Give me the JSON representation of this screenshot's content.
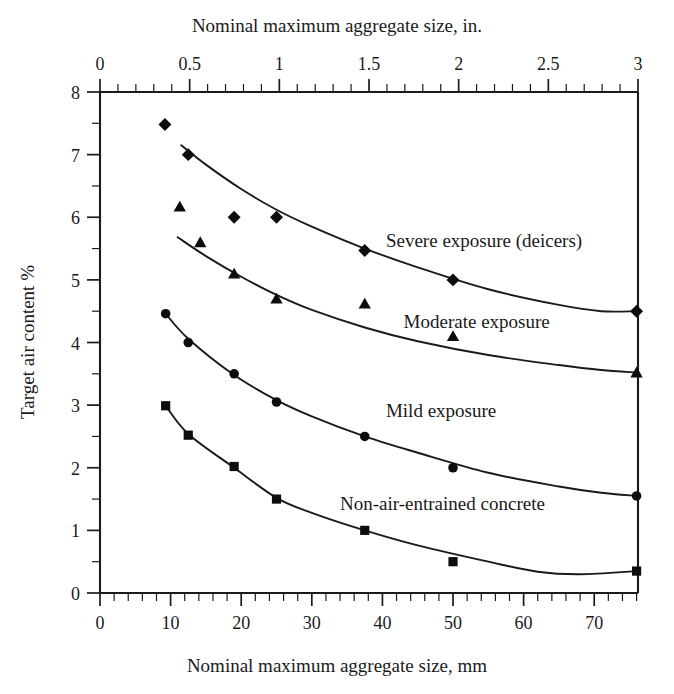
{
  "chart_data": {
    "type": "scatter",
    "title": "",
    "xlabel": "Nominal maximum aggregate size, mm",
    "xlabel_top": "Nominal maximum aggregate size, in.",
    "ylabel": "Target air content %",
    "xlim": [
      0,
      76.2
    ],
    "ylim": [
      0,
      8
    ],
    "grid": false,
    "legend_position": "inline-annotations",
    "x_ticks": [
      0,
      10,
      20,
      30,
      40,
      50,
      60,
      70
    ],
    "x_tick_labels": [
      "0",
      "10",
      "20",
      "30",
      "40",
      "50",
      "60",
      "70"
    ],
    "x_minor_step": 2,
    "x_ticks_top": [
      0,
      0.5,
      1,
      1.5,
      2,
      2.5,
      3
    ],
    "x_tick_labels_top": [
      "0",
      "0.5",
      "1",
      "1.5",
      "2",
      "2.5",
      "3"
    ],
    "x_minor_step_top": 0.1,
    "y_ticks": [
      0,
      1,
      2,
      3,
      4,
      5,
      6,
      7,
      8
    ],
    "y_tick_labels": [
      "0",
      "1",
      "2",
      "3",
      "4",
      "5",
      "6",
      "7",
      "8"
    ],
    "y_minor_step": 0.5,
    "series": [
      {
        "name": "Severe exposure (deicers)",
        "marker": "diamond",
        "marker_size": 11,
        "label_x": 40.5,
        "label_y": 5.62,
        "points": [
          {
            "x": 9.2,
            "y": 7.48
          },
          {
            "x": 12.5,
            "y": 7.0
          },
          {
            "x": 19.0,
            "y": 6.0
          },
          {
            "x": 25.0,
            "y": 6.0
          },
          {
            "x": 37.5,
            "y": 5.47
          },
          {
            "x": 50.0,
            "y": 5.0
          },
          {
            "x": 76.0,
            "y": 4.5
          }
        ],
        "curve": [
          {
            "x": 11.5,
            "y": 7.15
          },
          {
            "x": 15.0,
            "y": 6.84
          },
          {
            "x": 20.0,
            "y": 6.45
          },
          {
            "x": 25.0,
            "y": 6.12
          },
          {
            "x": 30.0,
            "y": 5.85
          },
          {
            "x": 37.5,
            "y": 5.5
          },
          {
            "x": 45.0,
            "y": 5.2
          },
          {
            "x": 55.0,
            "y": 4.85
          },
          {
            "x": 65.0,
            "y": 4.6
          },
          {
            "x": 71.0,
            "y": 4.5
          },
          {
            "x": 76.0,
            "y": 4.5
          }
        ]
      },
      {
        "name": "Moderate exposure",
        "marker": "triangle",
        "marker_size": 11,
        "label_x": 43.0,
        "label_y": 4.32,
        "points": [
          {
            "x": 11.3,
            "y": 6.17
          },
          {
            "x": 14.2,
            "y": 5.6
          },
          {
            "x": 19.0,
            "y": 5.1
          },
          {
            "x": 25.0,
            "y": 4.7
          },
          {
            "x": 37.5,
            "y": 4.62
          },
          {
            "x": 50.0,
            "y": 4.1
          },
          {
            "x": 76.0,
            "y": 3.52
          }
        ],
        "curve": [
          {
            "x": 11.0,
            "y": 5.68
          },
          {
            "x": 15.0,
            "y": 5.38
          },
          {
            "x": 20.0,
            "y": 5.05
          },
          {
            "x": 25.0,
            "y": 4.76
          },
          {
            "x": 30.0,
            "y": 4.52
          },
          {
            "x": 37.5,
            "y": 4.24
          },
          {
            "x": 45.0,
            "y": 4.02
          },
          {
            "x": 55.0,
            "y": 3.8
          },
          {
            "x": 65.0,
            "y": 3.64
          },
          {
            "x": 71.0,
            "y": 3.56
          },
          {
            "x": 76.0,
            "y": 3.52
          }
        ]
      },
      {
        "name": "Mild exposure",
        "marker": "circle",
        "marker_size": 10,
        "label_x": 40.5,
        "label_y": 2.9,
        "points": [
          {
            "x": 9.3,
            "y": 4.46
          },
          {
            "x": 12.5,
            "y": 4.0
          },
          {
            "x": 19.0,
            "y": 3.5
          },
          {
            "x": 25.0,
            "y": 3.05
          },
          {
            "x": 37.5,
            "y": 2.5
          },
          {
            "x": 50.0,
            "y": 2.0
          },
          {
            "x": 76.0,
            "y": 1.55
          }
        ],
        "curve": [
          {
            "x": 9.3,
            "y": 4.46
          },
          {
            "x": 12.5,
            "y": 4.06
          },
          {
            "x": 19.0,
            "y": 3.48
          },
          {
            "x": 25.0,
            "y": 3.08
          },
          {
            "x": 30.0,
            "y": 2.82
          },
          {
            "x": 37.5,
            "y": 2.5
          },
          {
            "x": 45.0,
            "y": 2.24
          },
          {
            "x": 55.0,
            "y": 1.92
          },
          {
            "x": 65.0,
            "y": 1.7
          },
          {
            "x": 71.0,
            "y": 1.6
          },
          {
            "x": 76.0,
            "y": 1.55
          }
        ]
      },
      {
        "name": "Non-air-entrained concrete",
        "marker": "square",
        "marker_size": 10,
        "label_x": 34.0,
        "label_y": 1.42,
        "points": [
          {
            "x": 9.3,
            "y": 2.99
          },
          {
            "x": 12.5,
            "y": 2.52
          },
          {
            "x": 19.0,
            "y": 2.02
          },
          {
            "x": 25.0,
            "y": 1.5
          },
          {
            "x": 37.5,
            "y": 1.0
          },
          {
            "x": 50.0,
            "y": 0.5
          },
          {
            "x": 76.0,
            "y": 0.35
          }
        ],
        "curve": [
          {
            "x": 9.3,
            "y": 2.99
          },
          {
            "x": 12.5,
            "y": 2.54
          },
          {
            "x": 19.0,
            "y": 2.0
          },
          {
            "x": 25.0,
            "y": 1.52
          },
          {
            "x": 30.0,
            "y": 1.28
          },
          {
            "x": 37.5,
            "y": 1.0
          },
          {
            "x": 45.0,
            "y": 0.76
          },
          {
            "x": 55.0,
            "y": 0.5
          },
          {
            "x": 62.0,
            "y": 0.34
          },
          {
            "x": 68.0,
            "y": 0.3
          },
          {
            "x": 76.0,
            "y": 0.35
          }
        ]
      }
    ]
  },
  "axes": {
    "top_title": "Nominal maximum aggregate size, in.",
    "bottom_title": "Nominal maximum aggregate size, mm",
    "left_title": "Target air content %"
  }
}
